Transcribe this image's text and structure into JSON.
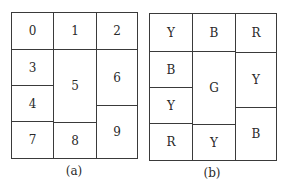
{
  "panels": [
    {
      "caption": "(a)",
      "cells": {
        "c0": "0",
        "c1": "1",
        "c2": "2",
        "c3": "3",
        "c4": "4",
        "c5": "5",
        "c6": "6",
        "c7": "7",
        "c8": "8",
        "c9": "9"
      }
    },
    {
      "caption": "(b)",
      "cells": {
        "c0": "Y",
        "c1": "B",
        "c2": "R",
        "c3": "B",
        "c4": "Y",
        "c5": "G",
        "c6": "Y",
        "c7": "R",
        "c8": "Y",
        "c9": "B"
      }
    }
  ]
}
